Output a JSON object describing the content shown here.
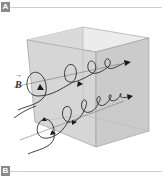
{
  "panels": [
    {
      "label": "A"
    },
    {
      "label": "B"
    }
  ],
  "figure": {
    "vector_label": "B",
    "vector_arrow": "→",
    "colors": {
      "box_face": "#d4d4d4",
      "box_edge": "#9a9a9a",
      "helix": "#2a2a2a",
      "label_bg": "#8a8a8a",
      "rule": "#cfcfcf"
    }
  }
}
